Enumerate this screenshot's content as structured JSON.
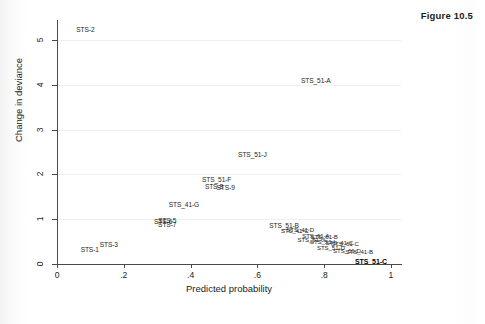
{
  "figure": {
    "title": "Figure 10.5"
  },
  "chart_data": {
    "type": "scatter",
    "title": "Figure 10.5",
    "xlabel": "Predicted probability",
    "ylabel": "Change in deviance",
    "xlim": [
      0,
      1.03
    ],
    "ylim": [
      0,
      5.45
    ],
    "xticks": [
      "0",
      ".2",
      ".4",
      ".6",
      ".8",
      "1"
    ],
    "xtick_values": [
      0,
      0.2,
      0.4,
      0.6,
      0.8,
      1
    ],
    "yticks": [
      "0",
      "1",
      "2",
      "3",
      "4",
      "5"
    ],
    "ytick_values": [
      0,
      1,
      2,
      3,
      4,
      5
    ],
    "grid": "horizontal-faint",
    "legend": "none",
    "marker_style": "label-only",
    "points": [
      {
        "label": "STS-2",
        "x": 0.085,
        "y": 5.22,
        "style": "normal"
      },
      {
        "label": "STS_51-A",
        "x": 0.775,
        "y": 4.08,
        "style": "normal"
      },
      {
        "label": "STS_51-J",
        "x": 0.585,
        "y": 2.44,
        "style": "normal"
      },
      {
        "label": "STS_51-F",
        "x": 0.478,
        "y": 1.88,
        "style": "normal"
      },
      {
        "label": "STS-8",
        "x": 0.47,
        "y": 1.72,
        "style": "normal"
      },
      {
        "label": "STS-9",
        "x": 0.505,
        "y": 1.7,
        "style": "normal"
      },
      {
        "label": "STS_41-G",
        "x": 0.38,
        "y": 1.32,
        "style": "normal"
      },
      {
        "label": "STS-5",
        "x": 0.33,
        "y": 0.97,
        "style": "normal"
      },
      {
        "label": "STS-6",
        "x": 0.318,
        "y": 0.93,
        "style": "normal"
      },
      {
        "label": "STS-7",
        "x": 0.33,
        "y": 0.88,
        "style": "normal"
      },
      {
        "label": "STS-3",
        "x": 0.155,
        "y": 0.42,
        "style": "normal"
      },
      {
        "label": "STS-1",
        "x": 0.098,
        "y": 0.31,
        "style": "normal"
      },
      {
        "label": "STS_51-B",
        "x": 0.68,
        "y": 0.85,
        "style": "normal"
      },
      {
        "label": "STS_41-D",
        "x": 0.728,
        "y": 0.76,
        "style": "tiny"
      },
      {
        "label": "STS_41-C",
        "x": 0.712,
        "y": 0.73,
        "style": "tiny"
      },
      {
        "label": "STS_61-A",
        "x": 0.775,
        "y": 0.63,
        "style": "tiny"
      },
      {
        "label": "STS_61-B",
        "x": 0.8,
        "y": 0.6,
        "style": "tiny"
      },
      {
        "label": "STS_51-G",
        "x": 0.762,
        "y": 0.54,
        "style": "tiny"
      },
      {
        "label": "STS_51-I",
        "x": 0.795,
        "y": 0.5,
        "style": "tiny"
      },
      {
        "label": "STS_41-C",
        "x": 0.845,
        "y": 0.47,
        "style": "tiny"
      },
      {
        "label": "STS_61-C",
        "x": 0.862,
        "y": 0.44,
        "style": "tiny"
      },
      {
        "label": "STS_51-D",
        "x": 0.82,
        "y": 0.36,
        "style": "tiny"
      },
      {
        "label": "STS_61-D",
        "x": 0.868,
        "y": 0.3,
        "style": "tiny"
      },
      {
        "label": "STS_41-B",
        "x": 0.905,
        "y": 0.27,
        "style": "tiny"
      },
      {
        "label": "STS_51-C",
        "x": 0.94,
        "y": 0.06,
        "style": "bold"
      }
    ]
  }
}
